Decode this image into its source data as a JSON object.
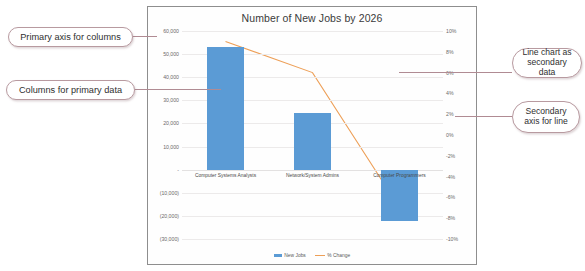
{
  "chart_data": {
    "type": "bar",
    "title": "Number of New Jobs by 2026",
    "xlabel": "",
    "ylabel": "",
    "categories": [
      "Computer Systems Analysts",
      "Network/System Admins",
      "Computer Programmers"
    ],
    "series": [
      {
        "name": "New Jobs",
        "type": "bar",
        "axis": "primary",
        "color": "#5b9bd5",
        "values": [
          53000,
          24500,
          -22000
        ]
      },
      {
        "name": "% Change",
        "type": "line",
        "axis": "secondary",
        "color": "#ed9f57",
        "values": [
          9,
          6,
          -7
        ]
      }
    ],
    "primary_axis": {
      "label": "",
      "ylim": [
        -30000,
        60000
      ],
      "ticks": [
        60000,
        50000,
        40000,
        30000,
        20000,
        10000,
        0,
        -10000,
        -20000,
        -30000
      ],
      "tick_labels": [
        "60,000",
        "50,000",
        "40,000",
        "30,000",
        "20,000",
        "10,000",
        "-",
        "(10,000)",
        "(20,000)",
        "(30,000)"
      ]
    },
    "secondary_axis": {
      "label": "",
      "ylim": [
        -10,
        10
      ],
      "ticks": [
        10,
        8,
        6,
        4,
        2,
        0,
        -2,
        -4,
        -6,
        -8,
        -10
      ],
      "tick_labels": [
        "10%",
        "8%",
        "6%",
        "4%",
        "2%",
        "0%",
        "-2%",
        "-4%",
        "-6%",
        "-8%",
        "-10%"
      ]
    },
    "grid": true,
    "legend_position": "bottom",
    "legend": [
      {
        "label": "New Jobs",
        "marker": "square",
        "color": "#5b9bd5"
      },
      {
        "label": "% Change",
        "marker": "line",
        "color": "#ed9f57"
      }
    ]
  },
  "annotations": [
    {
      "id": "primary-axis-columns",
      "text": "Primary axis for columns"
    },
    {
      "id": "columns-primary-data",
      "text": "Columns for primary data"
    },
    {
      "id": "line-chart-secondary",
      "text": "Line chart as secondary data"
    },
    {
      "id": "secondary-axis-line",
      "text": "Secondary axis for line"
    }
  ],
  "colors": {
    "bar": "#5b9bd5",
    "line": "#ed9f57",
    "callout_border": "#b89aa0",
    "leader": "#b08b93",
    "grid": "#eceaea",
    "frame": "#8e8e8e"
  }
}
